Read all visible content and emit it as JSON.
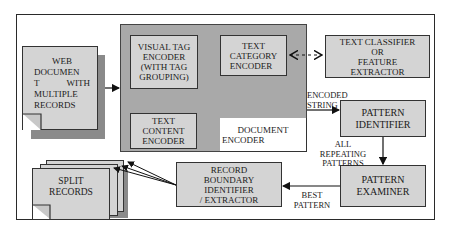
{
  "diagram": {
    "type": "flowchart",
    "nodes": {
      "web_document": {
        "lines": [
          "WEB",
          "DOCUMEN",
          "T        WITH",
          "MULTIPLE",
          "RECORDS"
        ]
      },
      "visual_tag_encoder": {
        "lines": [
          "VISUAL TAG",
          "ENCODER",
          "(WITH TAG",
          "GROUPING)"
        ]
      },
      "text_category_encoder": {
        "lines": [
          "TEXT",
          "CATEGORY",
          "ENCODER"
        ]
      },
      "text_content_encoder": {
        "lines": [
          "TEXT",
          "CONTENT",
          "ENCODER"
        ]
      },
      "document_encoder": {
        "lines": [
          "DOCUMENT",
          "ENCODER"
        ]
      },
      "text_classifier": {
        "lines": [
          "TEXT CLASSIFIER",
          "OR",
          "FEATURE",
          "EXTRACTOR"
        ]
      },
      "pattern_identifier": {
        "lines": [
          "PATTERN",
          "IDENTIFIER"
        ]
      },
      "pattern_examiner": {
        "lines": [
          "PATTERN",
          "EXAMINER"
        ]
      },
      "record_boundary": {
        "lines": [
          "RECORD",
          "BOUNDARY IDENTIFIER",
          "/ EXTRACTOR"
        ]
      },
      "split_records": {
        "lines": [
          "SPLIT",
          "RECORDS"
        ]
      }
    },
    "edge_labels": {
      "encoded_string": [
        "ENCODED",
        "STRING"
      ],
      "all_repeating_patterns": [
        "ALL",
        "REPEATING",
        "PATTERNS"
      ],
      "best_pattern": [
        "BEST",
        "PATTERN"
      ]
    },
    "edges": [
      {
        "from": "web_document",
        "to": "document_encoder_group",
        "style": "solid"
      },
      {
        "from": "text_category_encoder",
        "to": "text_classifier",
        "style": "dashed-bidirectional"
      },
      {
        "from": "document_encoder_group",
        "to": "pattern_identifier",
        "label": "ENCODED STRING",
        "style": "solid"
      },
      {
        "from": "pattern_identifier",
        "to": "pattern_examiner",
        "label": "ALL REPEATING PATTERNS",
        "style": "solid"
      },
      {
        "from": "pattern_examiner",
        "to": "record_boundary",
        "label": "BEST PATTERN",
        "style": "solid"
      },
      {
        "from": "record_boundary",
        "to": "split_records",
        "style": "solid-multi"
      }
    ],
    "colors": {
      "box_fill": "#d4d4d4",
      "group_fill": "#a9a9a9",
      "shadow": "#8a8a8a",
      "stroke": "#333333"
    }
  }
}
